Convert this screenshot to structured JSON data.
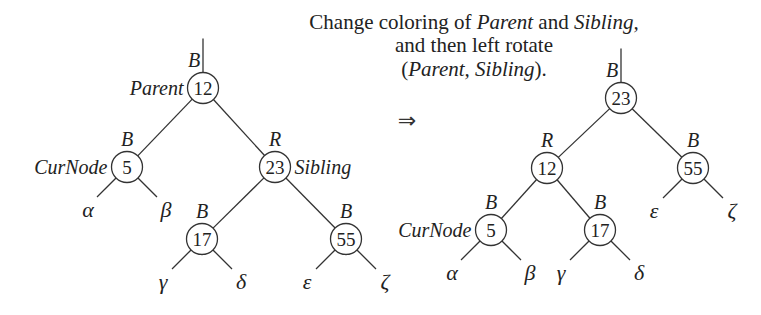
{
  "caption": {
    "line1": [
      {
        "text": "Change coloring of ",
        "italic": false
      },
      {
        "text": "Parent",
        "italic": true
      },
      {
        "text": " and ",
        "italic": false
      },
      {
        "text": "Sibling,",
        "italic": true
      }
    ],
    "line2": [
      {
        "text": "and then left rotate",
        "italic": false
      }
    ],
    "line3": [
      {
        "text": "(",
        "italic": false
      },
      {
        "text": "Parent, Sibling",
        "italic": true
      },
      {
        "text": ").",
        "italic": false
      }
    ]
  },
  "arrow": "⇒",
  "before_tree": {
    "nodes": [
      {
        "id": "12",
        "value": "12",
        "color": "B",
        "role": "Parent",
        "role_side": "left",
        "parent": null
      },
      {
        "id": "5",
        "value": "5",
        "color": "B",
        "role": "CurNode",
        "role_side": "left",
        "parent": "12"
      },
      {
        "id": "23",
        "value": "23",
        "color": "R",
        "role": "Sibling",
        "role_side": "right",
        "parent": "12"
      },
      {
        "id": "17",
        "value": "17",
        "color": "B",
        "role": "",
        "parent": "23"
      },
      {
        "id": "55",
        "value": "55",
        "color": "B",
        "role": "",
        "parent": "23"
      }
    ],
    "subtrees": [
      {
        "label": "α",
        "parent": "5"
      },
      {
        "label": "β",
        "parent": "5"
      },
      {
        "label": "γ",
        "parent": "17"
      },
      {
        "label": "δ",
        "parent": "17"
      },
      {
        "label": "ε",
        "parent": "55"
      },
      {
        "label": "ζ",
        "parent": "55"
      }
    ]
  },
  "after_tree": {
    "nodes": [
      {
        "id": "23",
        "value": "23",
        "color": "B",
        "role": "",
        "parent": null
      },
      {
        "id": "12",
        "value": "12",
        "color": "R",
        "role": "",
        "parent": "23"
      },
      {
        "id": "55",
        "value": "55",
        "color": "B",
        "role": "",
        "parent": "23"
      },
      {
        "id": "5",
        "value": "5",
        "color": "B",
        "role": "CurNode",
        "role_side": "left",
        "parent": "12"
      },
      {
        "id": "17",
        "value": "17",
        "color": "B",
        "role": "",
        "parent": "12"
      }
    ],
    "subtrees": [
      {
        "label": "α",
        "parent": "5"
      },
      {
        "label": "β",
        "parent": "5"
      },
      {
        "label": "γ",
        "parent": "17"
      },
      {
        "label": "δ",
        "parent": "17"
      },
      {
        "label": "ε",
        "parent": "55"
      },
      {
        "label": "ζ",
        "parent": "55"
      }
    ]
  }
}
